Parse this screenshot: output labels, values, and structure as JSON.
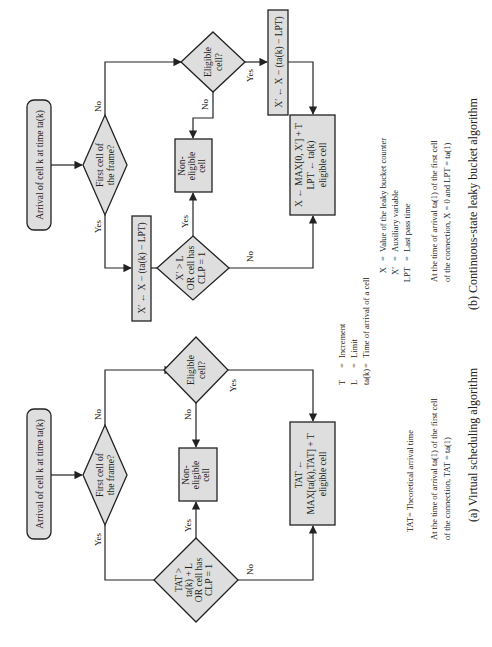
{
  "panel_a": {
    "start": "Arrival of cell k at time ta(k)",
    "first_cell": [
      "First cell of",
      "the frame?"
    ],
    "eligible": [
      "Eligible",
      "cell?"
    ],
    "non_eligible": [
      "Non-",
      "eligible",
      "cell"
    ],
    "condition": [
      "TAT >",
      "ta(k) + L",
      "OR cell has",
      "CLP = 1"
    ],
    "update": [
      "TAT ←",
      "MAX[ta(k),TAT] + T",
      "eligible cell"
    ],
    "labels": {
      "yes": "Yes",
      "no": "No"
    },
    "legend_tat": "TAT= Theoretical arrival time",
    "init": [
      "At the time of arrival ta(1) of the first cell",
      "of the connection, TAT = ta(1)"
    ],
    "caption": "(a) Virtual scheduling algorithm"
  },
  "panel_b": {
    "start": "Arrival of cell k at time ta(k)",
    "first_cell": [
      "First cell of",
      "the frame?"
    ],
    "eligible": [
      "Eligible",
      "cell?"
    ],
    "non_eligible": [
      "Non-",
      "eligible",
      "cell"
    ],
    "aux_left": "X′ ← X − (ta(k) − LPT)",
    "aux_right": "X′ ← X − (ta(k) − LPT)",
    "condition": [
      "X′ > L",
      "OR cell has",
      "CLP = 1"
    ],
    "update": [
      "X ← MAX[0, X′] + T",
      "LPT ← ta(k)",
      "eligible cell"
    ],
    "labels": {
      "yes": "Yes",
      "no": "No"
    },
    "legend": [
      {
        "sym": "X",
        "eq": "=",
        "desc": "Value of the leaky bucket counter"
      },
      {
        "sym": "X′",
        "eq": "=",
        "desc": "Auxiliary variable"
      },
      {
        "sym": "LPT",
        "eq": "=",
        "desc": "Last pass time"
      }
    ],
    "init": [
      "At the time of arrival ta(1) of the first cell",
      "of the connection, X = 0 and LPT = ta(1)"
    ],
    "caption": "(b) Continuous-state leaky bucket algorithm"
  },
  "shared_legend": [
    {
      "sym": "T",
      "eq": "=",
      "desc": "Increment"
    },
    {
      "sym": "L",
      "eq": "=",
      "desc": "Limit"
    },
    {
      "sym": "ta(k)",
      "eq": "=",
      "desc": "Time of arrival of a cell"
    }
  ]
}
